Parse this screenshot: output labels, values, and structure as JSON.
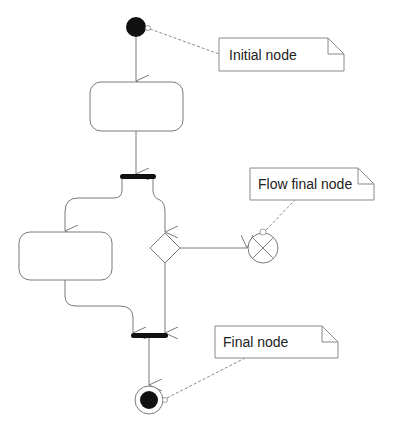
{
  "diagram": {
    "type": "UML activity diagram",
    "colors": {
      "line": "#7a7a7a",
      "node_fill": "#111111",
      "bar_fill": "#111111",
      "note_border": "#8a8a8a",
      "dashed": "#8a8a8a",
      "text": "#222222"
    },
    "notes": {
      "initial": {
        "label": "Initial node"
      },
      "flow_final": {
        "label": "Flow final node"
      },
      "final": {
        "label": "Final node"
      }
    },
    "nodes": {
      "initial_node": {
        "kind": "initial"
      },
      "action_1": {
        "kind": "action",
        "label": ""
      },
      "fork": {
        "kind": "fork"
      },
      "action_2": {
        "kind": "action",
        "label": ""
      },
      "decision": {
        "kind": "decision"
      },
      "flow_final": {
        "kind": "flow-final"
      },
      "join": {
        "kind": "join"
      },
      "final_node": {
        "kind": "activity-final"
      }
    }
  }
}
